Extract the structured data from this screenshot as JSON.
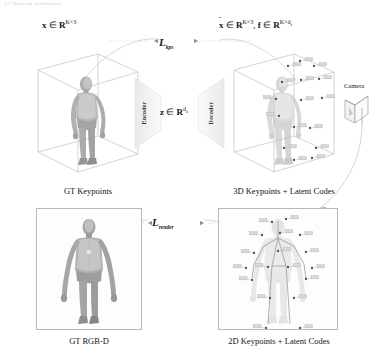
{
  "figure": {
    "title_strip": "3.2  Network Architecture",
    "top_left": {
      "formula_plain": "x ∈ R^{K×3}",
      "var": "x",
      "set": "R",
      "exp": "K×3"
    },
    "top_right": {
      "formula_plain": "x̂ ∈ R^{K×3}, f ∈ R^{K×d_f}",
      "var1": "x",
      "hat": "^",
      "set": "R",
      "exp1": "K×3",
      "comma": ",",
      "var2": "f",
      "exp2": "K×d",
      "exp2sub": "f"
    },
    "latent": {
      "var": "z",
      "set": "R",
      "exp": "d",
      "expsub": "z",
      "formula_plain": "z ∈ R^{d_z}"
    },
    "losses": {
      "kps": "L",
      "kps_sub": "kps",
      "kps_plain": "L_kps",
      "render": "L",
      "render_sub": "render",
      "render_plain": "L_render"
    },
    "encoder_label": "Encoder",
    "decoder_label": "Decoder",
    "camera_label": "Camera",
    "captions": {
      "gt_keypoints": "GT Keypoints",
      "kp3d_latent": "3D Keypoints + Latent Codes",
      "gt_rgbd": "GT RGB-D",
      "kp2d_latent": "2D Keypoints + Latent Codes"
    },
    "colors": {
      "ink": "#161616",
      "wire": "#bdbdbd",
      "body_dark": "#8e8e8e",
      "body_light": "#cfcfcf",
      "frame": "#b9b9b9",
      "arc": "#c4c4c4",
      "tag": "#9a9a9a"
    },
    "keypoints_3d": [
      {
        "x": 66,
        "y": 22,
        "tag": "t01"
      },
      {
        "x": 78,
        "y": 17,
        "tag": "t02"
      },
      {
        "x": 92,
        "y": 22,
        "tag": "t03"
      },
      {
        "x": 60,
        "y": 38,
        "tag": "t04"
      },
      {
        "x": 79,
        "y": 36,
        "tag": "t05"
      },
      {
        "x": 97,
        "y": 35,
        "tag": "t06"
      },
      {
        "x": 54,
        "y": 55,
        "tag": "t07"
      },
      {
        "x": 79,
        "y": 56,
        "tag": "t08"
      },
      {
        "x": 100,
        "y": 54,
        "tag": "t09"
      },
      {
        "x": 57,
        "y": 72,
        "tag": "t10"
      },
      {
        "x": 72,
        "y": 83,
        "tag": "t11"
      },
      {
        "x": 88,
        "y": 84,
        "tag": "t12"
      },
      {
        "x": 62,
        "y": 104,
        "tag": "t13"
      },
      {
        "x": 94,
        "y": 104,
        "tag": "t14"
      },
      {
        "x": 72,
        "y": 116,
        "tag": "t15"
      },
      {
        "x": 90,
        "y": 114,
        "tag": "t16"
      }
    ],
    "keypoints_2d": [
      {
        "x": 54,
        "y": 14,
        "tag": "s01"
      },
      {
        "x": 68,
        "y": 11,
        "tag": "s02"
      },
      {
        "x": 44,
        "y": 27,
        "tag": "s03"
      },
      {
        "x": 62,
        "y": 25,
        "tag": "s04"
      },
      {
        "x": 82,
        "y": 27,
        "tag": "s05"
      },
      {
        "x": 36,
        "y": 45,
        "tag": "s06"
      },
      {
        "x": 60,
        "y": 43,
        "tag": "s07"
      },
      {
        "x": 88,
        "y": 44,
        "tag": "s08"
      },
      {
        "x": 28,
        "y": 60,
        "tag": "s09"
      },
      {
        "x": 50,
        "y": 59,
        "tag": "s10"
      },
      {
        "x": 70,
        "y": 59,
        "tag": "s11"
      },
      {
        "x": 94,
        "y": 60,
        "tag": "s12"
      },
      {
        "x": 34,
        "y": 72,
        "tag": "s13"
      },
      {
        "x": 88,
        "y": 71,
        "tag": "s14"
      },
      {
        "x": 52,
        "y": 90,
        "tag": "s15"
      },
      {
        "x": 76,
        "y": 90,
        "tag": "s16"
      },
      {
        "x": 48,
        "y": 120,
        "tag": "s17"
      },
      {
        "x": 82,
        "y": 120,
        "tag": "s18"
      }
    ]
  }
}
